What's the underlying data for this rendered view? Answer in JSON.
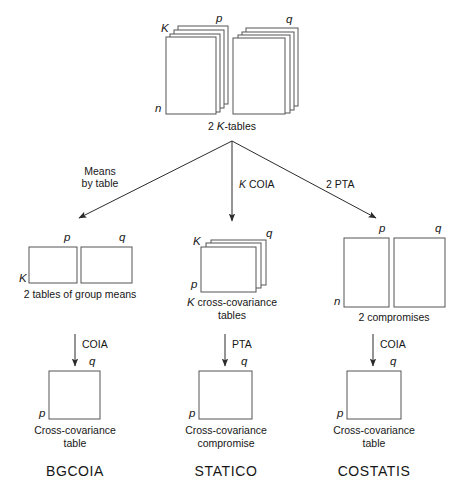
{
  "diagram": {
    "title_implicit": "",
    "top": {
      "stack_left": {
        "dim_rows": "n",
        "dim_cols": "p",
        "dim_depth": "K"
      },
      "stack_right": {
        "dim_cols": "q"
      },
      "caption_prefix": "2 ",
      "caption_italic": "K",
      "caption_suffix": "-tables",
      "caption_full": "2 K-tables"
    },
    "branch_arrows": [
      {
        "id": "left",
        "line1": "Means",
        "line2": "by table"
      },
      {
        "id": "center",
        "italic": "K",
        "text": " COIA",
        "full": "K COIA"
      },
      {
        "id": "right",
        "text": "2 PTA",
        "full": "2 PTA"
      }
    ],
    "columns": [
      {
        "id": "bgcoia",
        "middle": {
          "shape": "two-boxes-wide",
          "box1_top": "p",
          "box1_left": "K",
          "box2_top": "q",
          "caption": "2 tables of group means"
        },
        "arrow_label": "COIA",
        "bottom": {
          "top_right": "q",
          "bottom_left": "p",
          "caption_line1": "Cross-covariance",
          "caption_line2": "table"
        },
        "method": "BGCOIA"
      },
      {
        "id": "statico",
        "middle": {
          "shape": "stack",
          "depth": "K",
          "top_right": "q",
          "bottom_left": "p",
          "caption_italic": "K",
          "caption_line1": "K cross-covariance",
          "caption_line2": "tables"
        },
        "arrow_label": "PTA",
        "bottom": {
          "top_right": "q",
          "bottom_left": "p",
          "caption_line1": "Cross-covariance",
          "caption_line2": "compromise"
        },
        "method": "STATICO"
      },
      {
        "id": "costatis",
        "middle": {
          "shape": "two-boxes-tall",
          "box1_top": "p",
          "box1_left": "n",
          "box2_top": "q",
          "caption": "2 compromises"
        },
        "arrow_label": "COIA",
        "bottom": {
          "top_right": "q",
          "bottom_left": "p",
          "caption_line1": "Cross-covariance",
          "caption_line2": "table"
        },
        "method": "COSTATIS"
      }
    ],
    "colors": {
      "stroke": "#4a4a4a",
      "arrow": "#2b2b2b",
      "text": "#161616",
      "background": "#ffffff"
    }
  }
}
